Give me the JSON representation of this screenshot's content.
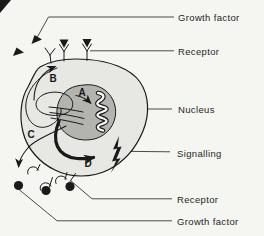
{
  "palette": {
    "page_bg": "#f5f5f1",
    "cell_fill": "#e7e7e3",
    "nucleus_fill": "#b3b3af",
    "ink": "#1a1a1a",
    "leader": "#4b4b49",
    "label_ink": "#262626"
  },
  "labels": [
    {
      "id": "growth-factor-top",
      "text": "Growth factor"
    },
    {
      "id": "receptor-top",
      "text": "Receptor"
    },
    {
      "id": "nucleus",
      "text": "Nucleus"
    },
    {
      "id": "signalling",
      "text": "Signalling"
    },
    {
      "id": "receptor-bottom",
      "text": "Receptor"
    },
    {
      "id": "growth-factor-bottom",
      "text": "Growth factor"
    }
  ],
  "markers": [
    {
      "id": "a",
      "text": "A"
    },
    {
      "id": "b",
      "text": "B"
    },
    {
      "id": "c",
      "text": "C"
    },
    {
      "id": "d",
      "text": "D"
    }
  ]
}
